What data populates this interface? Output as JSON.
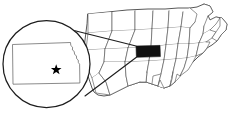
{
  "figure": {
    "type": "locator-map",
    "colors": {
      "background": "#ffffff",
      "highlight": "#111111",
      "state_border": "#4a4a4a",
      "country_border": "#3a3a3a",
      "inset_border": "#1c1c1c",
      "marker": "#000000"
    }
  },
  "map": {
    "region_name": "Contiguous United States",
    "highlighted_state": "Kansas",
    "highlight_color": "#111111",
    "state_count": 48
  },
  "inset": {
    "shape": "circle",
    "subject": "Kansas",
    "marker": {
      "symbol": "star",
      "label": "State capital",
      "meaning": "Topeka"
    },
    "leader_lines": 2
  }
}
